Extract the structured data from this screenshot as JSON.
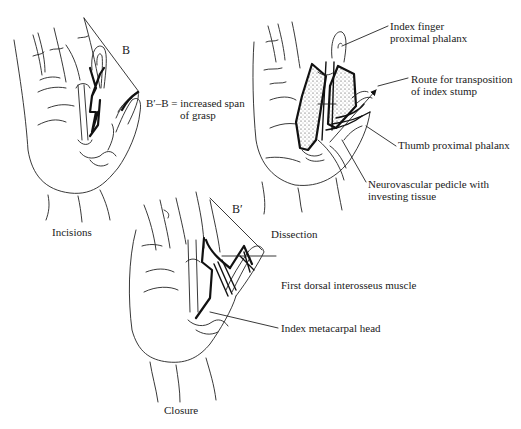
{
  "figure": {
    "panels": [
      {
        "id": "incisions",
        "caption": "Incisions",
        "labels": {
          "b": "B",
          "span_line1": "B′–B = increased span",
          "span_line2": "of grasp"
        }
      },
      {
        "id": "dissection",
        "caption": "Dissection",
        "labels": {
          "index_line1": "Index finger",
          "index_line2": "proximal phalanx",
          "route_line1": "Route for transposition",
          "route_line2": "of index stump",
          "thumb": "Thumb proximal phalanx",
          "pedicle_line1": "Neurovascular pedicle with",
          "pedicle_line2": "investing tissue"
        }
      },
      {
        "id": "closure",
        "caption": "Closure",
        "labels": {
          "b_prime": "B′",
          "muscle": "First dorsal interosseus muscle",
          "metacarpal": "Index metacarpal head"
        }
      }
    ],
    "colors": {
      "ink": "#1a1a1a",
      "background": "#ffffff"
    }
  }
}
